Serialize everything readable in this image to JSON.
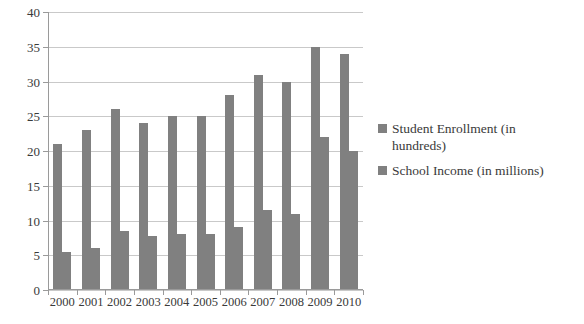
{
  "chart_data": {
    "type": "bar",
    "title": "",
    "xlabel": "",
    "ylabel": "",
    "ylim": [
      0,
      40
    ],
    "ytick_step": 5,
    "yticks": [
      "0",
      "5",
      "10",
      "15",
      "20",
      "25",
      "30",
      "35",
      "40"
    ],
    "grid": true,
    "legend_position": "right",
    "categories": [
      "2000",
      "2001",
      "2002",
      "2003",
      "2004",
      "2005",
      "2006",
      "2007",
      "2008",
      "2009",
      "2010"
    ],
    "series": [
      {
        "name": "Student Enrollment (in hundreds)",
        "color": "#808080",
        "values": [
          21,
          23,
          26,
          24,
          25,
          25,
          28,
          31,
          30,
          35,
          34
        ]
      },
      {
        "name": "School Income (in millions)",
        "color": "#808080",
        "values": [
          5.5,
          6,
          8.5,
          7.8,
          8,
          8,
          9,
          11.5,
          11,
          22,
          20
        ]
      }
    ]
  },
  "colors": {
    "bar": "#808080",
    "gridline": "#c9c9c9",
    "axis": "#9a9a9a",
    "text": "#3a3a3a",
    "background": "#ffffff"
  }
}
